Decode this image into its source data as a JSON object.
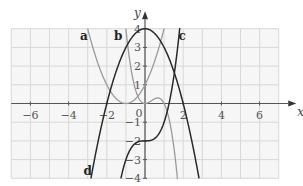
{
  "chart_data": {
    "type": "line",
    "title": "",
    "xlabel": "x",
    "ylabel": "y",
    "xlim": [
      -7,
      7
    ],
    "ylim": [
      -4,
      4
    ],
    "grid": true,
    "x_ticks": [
      -6,
      -4,
      -2,
      0,
      2,
      4,
      6
    ],
    "x_tick_labels": [
      "−6",
      "−4",
      "−2",
      "0",
      "2",
      "4",
      "6"
    ],
    "y_ticks": [
      -4,
      -3,
      -2,
      -1,
      1,
      2,
      3,
      4
    ],
    "y_tick_labels": [
      "−4",
      "−3",
      "−2",
      "−1",
      "1",
      "2",
      "3",
      "4"
    ],
    "series": [
      {
        "name": "a",
        "color": "#9a9a9a",
        "formula": "(x+1)^2",
        "x_range": [
          -3,
          1
        ],
        "points": [
          [
            -3,
            4
          ],
          [
            -2,
            1
          ],
          [
            -1,
            0
          ],
          [
            0,
            1
          ],
          [
            1,
            4
          ]
        ]
      },
      {
        "name": "b",
        "color": "#9a9a9a",
        "formula": "2x^2(1-x)",
        "x_range": [
          -1,
          1.7
        ],
        "points": [
          [
            -1,
            4
          ],
          [
            -0.5,
            0.75
          ],
          [
            0,
            0
          ],
          [
            0.67,
            0.3
          ],
          [
            1,
            0
          ],
          [
            1.5,
            -2.25
          ],
          [
            1.7,
            -4
          ]
        ]
      },
      {
        "name": "c",
        "color": "#2a2a2a",
        "formula": "x^3-2",
        "x_range": [
          -1.26,
          1.82
        ],
        "points": [
          [
            -1.26,
            -4
          ],
          [
            -1,
            -3
          ],
          [
            0,
            -2
          ],
          [
            1,
            -1
          ],
          [
            1.26,
            0
          ],
          [
            1.82,
            4
          ]
        ]
      },
      {
        "name": "d",
        "color": "#2a2a2a",
        "formula": "4-x^2",
        "x_range": [
          -2.83,
          2.83
        ],
        "points": [
          [
            -2.83,
            -4
          ],
          [
            -2,
            0
          ],
          [
            0,
            4
          ],
          [
            2,
            0
          ],
          [
            2.83,
            -4
          ]
        ]
      }
    ],
    "labels": [
      {
        "text": "a",
        "x": -3.2,
        "y": 3.6
      },
      {
        "text": "b",
        "x": -1.4,
        "y": 3.6
      },
      {
        "text": "c",
        "x": 1.95,
        "y": 3.6
      },
      {
        "text": "d",
        "x": -3.0,
        "y": -3.6
      }
    ]
  },
  "axes": {
    "x_label": "x",
    "y_label": "y",
    "origin_label": "0"
  }
}
